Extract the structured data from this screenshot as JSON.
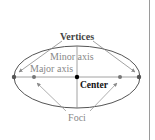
{
  "diagram": {
    "labels": {
      "vertices": "Vertices",
      "minor_axis": "Minor axis",
      "major_axis": "Major axis",
      "center": "Center",
      "foci": "Foci"
    },
    "colors": {
      "ellipse": "#555555",
      "axis": "#8c8c8c",
      "arrow": "#9a9a9a",
      "label_gray": "#888888",
      "label_dark": "#333333",
      "center_label": "#111111",
      "dot": "#666666",
      "center_dot": "#000000",
      "border": "#9a9a9a"
    }
  }
}
